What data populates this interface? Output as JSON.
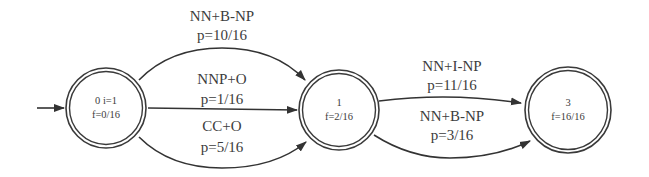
{
  "diagram": {
    "title": "",
    "nodes": [
      {
        "id": "0",
        "line1": "0  i=1",
        "line2": "f=0/16",
        "is_initial": true
      },
      {
        "id": "1",
        "line1": "1",
        "line2": "f=2/16",
        "is_initial": false
      },
      {
        "id": "3",
        "line1": "3",
        "line2": "f=16/16",
        "is_initial": false
      }
    ],
    "edges": [
      {
        "from": "0",
        "to": "1",
        "tag": "NN+B-NP",
        "prob": "p=10/16",
        "route": "upper arc"
      },
      {
        "from": "0",
        "to": "1",
        "tag": "NNP+O",
        "prob": "p=1/16",
        "route": "straight"
      },
      {
        "from": "0",
        "to": "1",
        "tag": "CC+O",
        "prob": "p=5/16",
        "route": "lower arc"
      },
      {
        "from": "1",
        "to": "3",
        "tag": "NN+I-NP",
        "prob": "p=11/16",
        "route": "upper arc"
      },
      {
        "from": "1",
        "to": "3",
        "tag": "NN+B-NP",
        "prob": "p=3/16",
        "route": "lower arc"
      }
    ],
    "colors": {
      "stroke": "#333333",
      "text": "#3c3c3c",
      "background": "#ffffff"
    }
  }
}
